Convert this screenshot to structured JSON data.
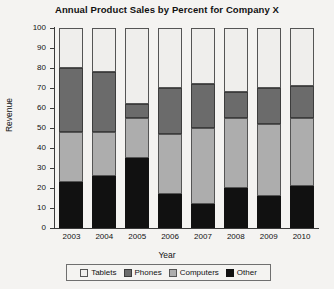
{
  "chart_data": {
    "type": "bar",
    "title": "Annual Product Sales by Percent for Company X",
    "xlabel": "Year",
    "ylabel": "Revenue",
    "ylim": [
      0,
      100
    ],
    "ytick_labels": [
      "100",
      "90",
      "80",
      "70",
      "60",
      "50",
      "40",
      "30",
      "20",
      "10",
      "0"
    ],
    "ytick_values": [
      100,
      90,
      80,
      70,
      60,
      50,
      40,
      30,
      20,
      10,
      0
    ],
    "grid": false,
    "stacked": true,
    "stack_order_bottom_to_top": [
      "Other",
      "Computers",
      "Phones",
      "Tablets"
    ],
    "legend_position": "bottom",
    "categories": [
      "2003",
      "2004",
      "2005",
      "2006",
      "2007",
      "2008",
      "2009",
      "2010"
    ],
    "series": [
      {
        "name": "Other",
        "color": "#111111",
        "values": [
          23,
          26,
          35,
          17,
          12,
          20,
          16,
          21
        ]
      },
      {
        "name": "Computers",
        "color": "#adadad",
        "values": [
          25,
          22,
          20,
          30,
          38,
          35,
          36,
          34
        ]
      },
      {
        "name": "Phones",
        "color": "#6b6b6b",
        "values": [
          32,
          30,
          7,
          23,
          22,
          13,
          18,
          16
        ]
      },
      {
        "name": "Tablets",
        "color": "#efeeec",
        "values": [
          20,
          22,
          38,
          30,
          28,
          32,
          30,
          29
        ]
      }
    ]
  },
  "legend": {
    "items": [
      {
        "label": "Tablets"
      },
      {
        "label": "Phones"
      },
      {
        "label": "Computers"
      },
      {
        "label": "Other"
      }
    ]
  }
}
